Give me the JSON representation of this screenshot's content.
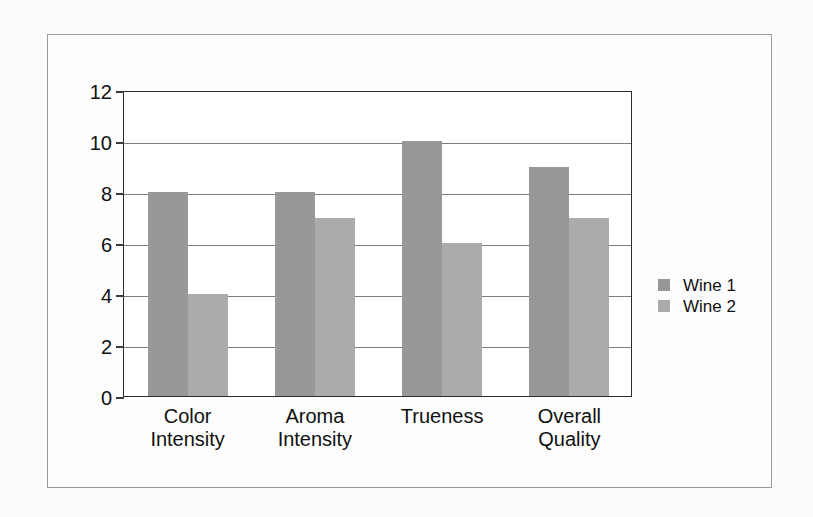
{
  "chart_data": {
    "type": "bar",
    "title": "",
    "xlabel": "",
    "ylabel": "",
    "categories": [
      "Color Intensity",
      "Aroma Intensity",
      "Trueness",
      "Overall Quality"
    ],
    "category_lines": [
      [
        "Color",
        "Intensity"
      ],
      [
        "Aroma",
        "Intensity"
      ],
      [
        "Trueness"
      ],
      [
        "Overall",
        "Quality"
      ]
    ],
    "series": [
      {
        "name": "Wine 1",
        "color": "#989898",
        "values": [
          8,
          8,
          10,
          9
        ]
      },
      {
        "name": "Wine 2",
        "color": "#ababab",
        "values": [
          4,
          7,
          6,
          7
        ]
      }
    ],
    "ylim": [
      0,
      12
    ],
    "yticks": [
      0,
      2,
      4,
      6,
      8,
      10,
      12
    ],
    "ytick_labels": [
      "0",
      "2",
      "4",
      "6",
      "8",
      "10",
      "12"
    ],
    "grid": true,
    "grid_axis": "y",
    "legend_position": "right",
    "legend_entries": [
      "Wine 1",
      "Wine 2"
    ]
  },
  "figure": {
    "frame_color": "#9a9a9a",
    "plot_border_color": "#2b2b2b",
    "gridline_color": "#7d7d7d",
    "background_color": "#fbfbfb"
  }
}
